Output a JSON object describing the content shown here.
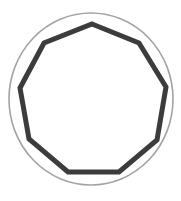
{
  "diagram": {
    "title": "",
    "shape": "nonagon inscribed in circle",
    "canvas": {
      "width": 181,
      "height": 201,
      "background": "#ffffff"
    },
    "circle": {
      "cx": 91,
      "cy": 99,
      "rx": 82,
      "ry": 86,
      "stroke": "#a3a3a3",
      "stroke_width": 1.6,
      "fill": "none"
    },
    "polygon": {
      "sides": 9,
      "stroke": "#3c3c3c",
      "stroke_width": 5,
      "fill": "#ffffff",
      "vertices": [
        [
          92,
          24
        ],
        [
          139,
          43
        ],
        [
          166,
          87
        ],
        [
          157,
          140
        ],
        [
          119,
          172
        ],
        [
          68,
          172
        ],
        [
          29,
          139
        ],
        [
          20,
          88
        ],
        [
          44,
          43
        ]
      ]
    }
  }
}
